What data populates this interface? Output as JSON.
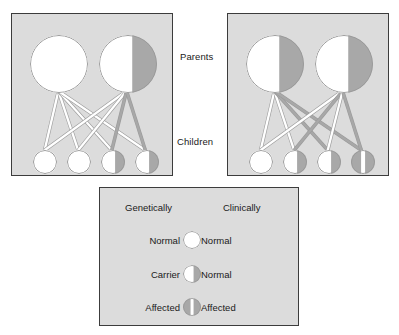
{
  "figure": {
    "background_color": "#ffffff",
    "panel_fill": "#dcdcdc",
    "panel_border": "#3c3c3c",
    "normal_color": "#ffffff",
    "affected_color": "#a8a8a8",
    "outline_color": "#9a9a9a",
    "divider_color": "#ffffff"
  },
  "row_labels": {
    "parents": "Parents",
    "children": "Children"
  },
  "panels": [
    {
      "id": "left",
      "name": "cross-normal-x-carrier",
      "parents": [
        {
          "name": "parent-1",
          "status": "normal",
          "cx": 47,
          "cy": 50,
          "r": 29
        },
        {
          "name": "parent-2",
          "status": "carrier",
          "cx": 116,
          "cy": 50,
          "r": 29
        }
      ],
      "children": [
        {
          "name": "child-1",
          "status": "normal",
          "cx": 33,
          "cy": 148,
          "r": 12
        },
        {
          "name": "child-2",
          "status": "normal",
          "cx": 67,
          "cy": 148,
          "r": 12
        },
        {
          "name": "child-3",
          "status": "carrier",
          "cx": 101,
          "cy": 148,
          "r": 12
        },
        {
          "name": "child-4",
          "status": "carrier",
          "cx": 135,
          "cy": 148,
          "r": 12
        }
      ],
      "links": [
        {
          "from": "parent-1",
          "to": "child-1",
          "allele": "normal"
        },
        {
          "from": "parent-1",
          "to": "child-2",
          "allele": "normal"
        },
        {
          "from": "parent-1",
          "to": "child-3",
          "allele": "normal"
        },
        {
          "from": "parent-1",
          "to": "child-4",
          "allele": "normal"
        },
        {
          "from": "parent-2",
          "to": "child-1",
          "allele": "normal"
        },
        {
          "from": "parent-2",
          "to": "child-2",
          "allele": "normal"
        },
        {
          "from": "parent-2",
          "to": "child-3",
          "allele": "affected"
        },
        {
          "from": "parent-2",
          "to": "child-4",
          "allele": "affected"
        }
      ]
    },
    {
      "id": "right",
      "name": "cross-carrier-x-carrier",
      "parents": [
        {
          "name": "parent-1",
          "status": "carrier",
          "cx": 47,
          "cy": 50,
          "r": 29
        },
        {
          "name": "parent-2",
          "status": "carrier",
          "cx": 116,
          "cy": 50,
          "r": 29
        }
      ],
      "children": [
        {
          "name": "child-1",
          "status": "normal",
          "cx": 33,
          "cy": 148,
          "r": 12
        },
        {
          "name": "child-2",
          "status": "carrier",
          "cx": 67,
          "cy": 148,
          "r": 12
        },
        {
          "name": "child-3",
          "status": "carrier",
          "cx": 101,
          "cy": 148,
          "r": 12
        },
        {
          "name": "child-4",
          "status": "affected",
          "cx": 135,
          "cy": 148,
          "r": 12
        }
      ],
      "links": [
        {
          "from": "parent-1",
          "to": "child-1",
          "allele": "normal"
        },
        {
          "from": "parent-1",
          "to": "child-2",
          "allele": "normal"
        },
        {
          "from": "parent-1",
          "to": "child-3",
          "allele": "affected"
        },
        {
          "from": "parent-1",
          "to": "child-4",
          "allele": "affected"
        },
        {
          "from": "parent-2",
          "to": "child-1",
          "allele": "normal"
        },
        {
          "from": "parent-2",
          "to": "child-2",
          "allele": "affected"
        },
        {
          "from": "parent-2",
          "to": "child-3",
          "allele": "normal"
        },
        {
          "from": "parent-2",
          "to": "child-4",
          "allele": "affected"
        }
      ]
    }
  ],
  "legend": {
    "headers": {
      "genetically": "Genetically",
      "clinically": "Clinically"
    },
    "rows": [
      {
        "genetically": "Normal",
        "clinically": "Normal",
        "symbol": "normal"
      },
      {
        "genetically": "Carrier",
        "clinically": "Normal",
        "symbol": "carrier"
      },
      {
        "genetically": "Affected",
        "clinically": "Affected",
        "symbol": "affected"
      }
    ]
  }
}
